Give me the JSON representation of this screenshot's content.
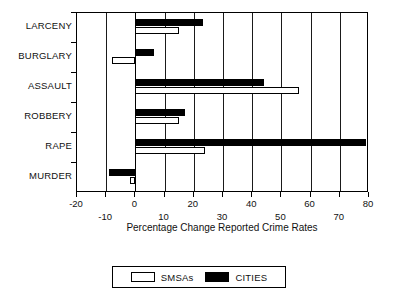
{
  "chart_data": {
    "type": "bar",
    "orientation": "horizontal",
    "title": "",
    "xlabel": "Percentage Change Reported Crime Rates",
    "ylabel": "",
    "xlim": [
      -20,
      80
    ],
    "xticks": [
      -20,
      -10,
      0,
      10,
      20,
      30,
      40,
      50,
      60,
      70,
      80
    ],
    "xtick_labels": [
      "-20",
      "-10",
      "0",
      "10",
      "20",
      "30",
      "40",
      "50",
      "60",
      "70",
      "80"
    ],
    "grid": true,
    "grid_axis": "x",
    "legend_position": "below-center",
    "categories": [
      "LARCENY",
      "BURGLARY",
      "ASSAULT",
      "ROBBERY",
      "RAPE",
      "MURDER"
    ],
    "series": [
      {
        "name": "SMSAs",
        "style": "open",
        "color": "#ffffff",
        "edge_color": "#000000",
        "values": [
          15,
          -8,
          56,
          15,
          24,
          -2
        ]
      },
      {
        "name": "CITIES",
        "style": "filled",
        "color": "#000000",
        "edge_color": "#000000",
        "values": [
          23,
          6.5,
          44,
          17,
          79,
          -9
        ]
      }
    ]
  },
  "axis": {
    "title": "Percentage Change Reported Crime Rates",
    "tick_labels_upper": [
      "-20",
      "0",
      "20",
      "40",
      "60",
      "80"
    ],
    "tick_labels_lower": [
      "-10",
      "10",
      "30",
      "50",
      "70"
    ]
  },
  "legend": {
    "entries": [
      {
        "label": "SMSAs",
        "swatch": "open-square-icon"
      },
      {
        "label": "CITIES",
        "swatch": "filled-square-icon"
      }
    ]
  }
}
